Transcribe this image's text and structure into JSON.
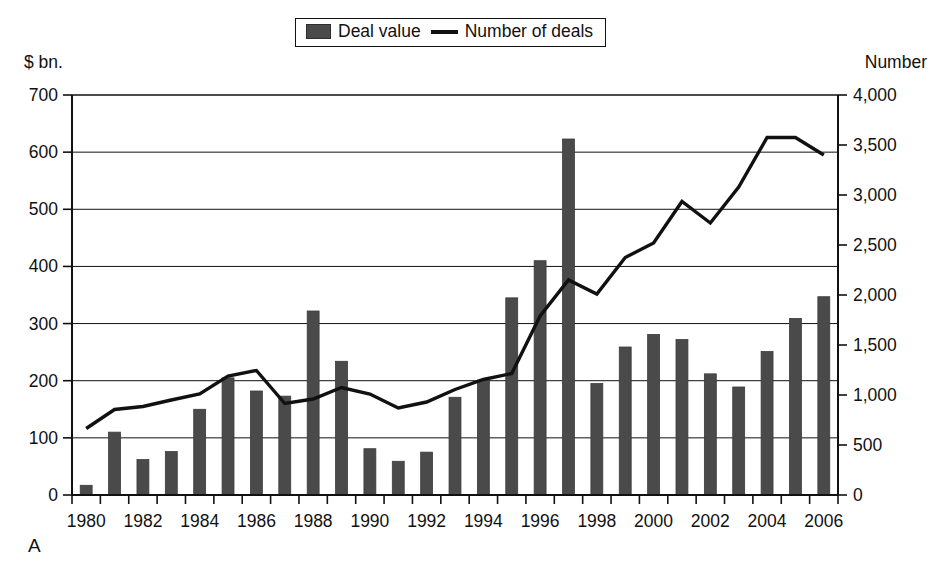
{
  "figure": {
    "panel_letter": "A",
    "left_axis_caption": "$ bn.",
    "right_axis_caption": "Number"
  },
  "legend": {
    "entries": [
      {
        "label": "Deal value",
        "marker": "bar-swatch-icon",
        "color": "#4a4a4a"
      },
      {
        "label": "Number of deals",
        "marker": "line-swatch-icon",
        "color": "#111111"
      }
    ]
  },
  "chart_data": {
    "type": "bar",
    "title": "",
    "xlabel": "",
    "ylabel": "$ bn.",
    "y2label": "Number",
    "grid": true,
    "legend_position": "top-center",
    "ylim": [
      0,
      700
    ],
    "y2lim": [
      0,
      4000
    ],
    "yticks": [
      0,
      100,
      200,
      300,
      400,
      500,
      600,
      700
    ],
    "ytick_labels": [
      "0",
      "100",
      "200",
      "300",
      "400",
      "500",
      "600",
      "700"
    ],
    "y2ticks": [
      0,
      500,
      1000,
      1500,
      2000,
      2500,
      3000,
      3500,
      4000
    ],
    "y2tick_labels": [
      "0",
      "500",
      "1,000",
      "1,500",
      "2,000",
      "2,500",
      "3,000",
      "3,500",
      "4,000"
    ],
    "categories": [
      "1980",
      "1981",
      "1982",
      "1983",
      "1984",
      "1985",
      "1986",
      "1987",
      "1988",
      "1989",
      "1990",
      "1991",
      "1992",
      "1993",
      "1994",
      "1995",
      "1996",
      "1997",
      "1998",
      "1999",
      "2000",
      "2001",
      "2002",
      "2003",
      "2004",
      "2005",
      "2006"
    ],
    "xtick_labels_shown": [
      "1980",
      "1982",
      "1984",
      "1986",
      "1988",
      "1990",
      "1992",
      "1994",
      "1996",
      "1998",
      "2000",
      "2002",
      "2004",
      "2006"
    ],
    "series": [
      {
        "name": "Deal value",
        "axis": "left",
        "unit": "$ bn.",
        "type": "bar",
        "color": "#4a4a4a",
        "values": [
          17,
          110,
          62,
          76,
          150,
          205,
          182,
          173,
          322,
          234,
          81,
          59,
          75,
          171,
          201,
          345,
          410,
          623,
          195,
          259,
          281,
          272,
          212,
          189,
          251,
          309,
          347
        ]
      },
      {
        "name": "Number of deals",
        "axis": "right",
        "unit": "Number",
        "type": "line",
        "color": "#111111",
        "values": [
          665,
          855,
          885,
          950,
          1010,
          1190,
          1245,
          915,
          960,
          1075,
          1010,
          870,
          930,
          1055,
          1155,
          1215,
          1790,
          2150,
          2010,
          2375,
          2520,
          2935,
          2720,
          3080,
          3575,
          3575,
          3400
        ]
      }
    ]
  }
}
